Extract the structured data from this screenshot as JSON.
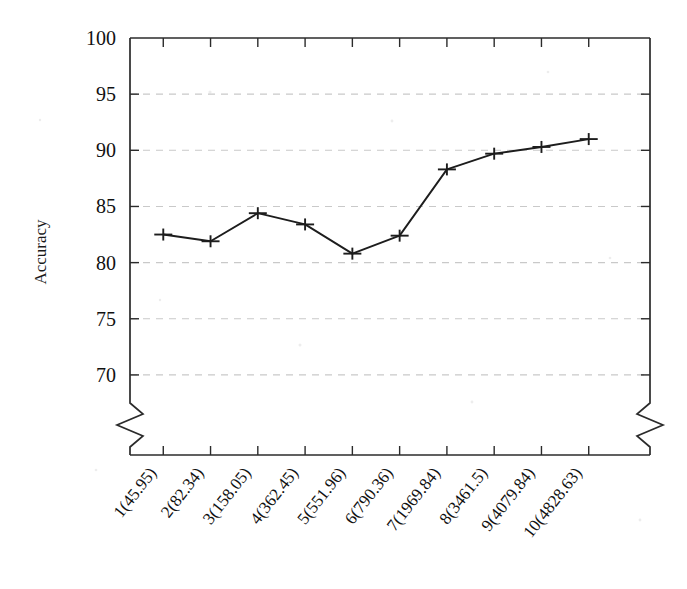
{
  "chart_data": {
    "type": "line",
    "title": "",
    "xlabel": "",
    "ylabel": "Accuracy",
    "categories": [
      "1(45.95)",
      "2(82.34)",
      "3(158.05)",
      "4(362.45)",
      "5(551.96)",
      "6(790.36)",
      "7(1969.84)",
      "8(3461.5)",
      "9(4079.84)",
      "10(4828.63)"
    ],
    "values": [
      82.5,
      81.9,
      84.4,
      83.4,
      80.8,
      82.4,
      88.3,
      89.7,
      90.3,
      91.0
    ],
    "series": [
      {
        "name": "Accuracy",
        "values": [
          82.5,
          81.9,
          84.4,
          83.4,
          80.8,
          82.4,
          88.3,
          89.7,
          90.3,
          91.0
        ]
      }
    ],
    "ylim": [
      67.5,
      100
    ],
    "yticks": [
      70,
      75,
      80,
      85,
      90,
      95,
      100
    ],
    "ytick_labels": [
      "70",
      "75",
      "80",
      "85",
      "90",
      "95",
      "100"
    ],
    "grid": true,
    "grid_axis": "y",
    "legend": "none",
    "axis_break": {
      "y_axis": true,
      "right_axis": true,
      "note": "zigzag break near bottom of vertical axes"
    },
    "marker_style": "horizontal-bar-with-vertical-tick",
    "line_color": "#1d1d1d",
    "grid_color": "#c9c9c9",
    "axis_color": "#2b2b2b",
    "background_color": "#ffffff"
  }
}
